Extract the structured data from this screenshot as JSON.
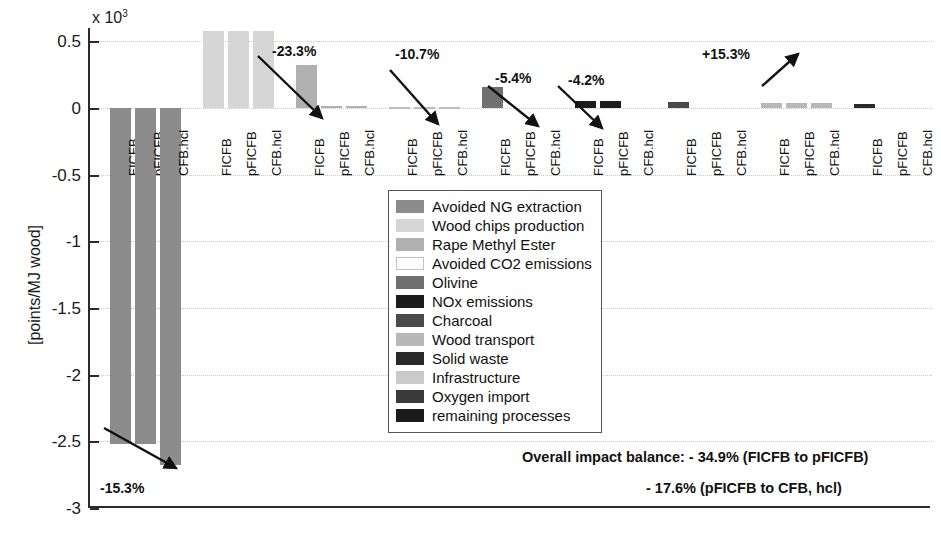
{
  "chart_data": {
    "type": "bar",
    "title": "",
    "xlabel": "",
    "ylabel": "[points/MJ wood]",
    "y_multiplier": "x 10",
    "y_multiplier_exponent": "3",
    "ylim": [
      -3,
      0.6
    ],
    "yticks": [
      0.5,
      0,
      -0.5,
      -1,
      -1.5,
      -2,
      -2.5,
      -3
    ],
    "ytick_labels": [
      "0.5",
      "0",
      "-0.5",
      "-1",
      "-1.5",
      "-2",
      "-2.5",
      "-3"
    ],
    "grid": true,
    "legend_position": "center",
    "categories": [
      "FICFB",
      "pFICFB",
      "CFB.hcl"
    ],
    "series": [
      {
        "name": "Avoided NG extraction",
        "color": "#8c8c8c",
        "values": [
          -2.52,
          -2.52,
          -2.68
        ]
      },
      {
        "name": "Wood chips production",
        "color": "#d6d6d6",
        "values": [
          0.58,
          0.58,
          0.58
        ]
      },
      {
        "name": "Rape Methyl Ester",
        "color": "#b0b0b0",
        "values": [
          0.32,
          0.012,
          0.012
        ]
      },
      {
        "name": "Avoided CO2 emissions",
        "color": "#fdfdfd",
        "values": [
          0.004,
          0.004,
          0.004
        ]
      },
      {
        "name": "Olivine",
        "color": "#707070",
        "values": [
          0.155,
          0.0,
          0.0
        ]
      },
      {
        "name": "NOx emissions",
        "color": "#1c1c1c",
        "values": [
          0.052,
          0.052,
          0.0
        ]
      },
      {
        "name": "Charcoal",
        "color": "#4a4a4a",
        "values": [
          0.048,
          0.0,
          0.0
        ]
      },
      {
        "name": "Wood transport",
        "color": "#b8b8b8",
        "values": [
          0.038,
          0.038,
          0.038
        ]
      },
      {
        "name": "Solid waste",
        "color": "#2a2a2a",
        "values": [
          0.028,
          0.0,
          0.0
        ]
      },
      {
        "name": "Infrastructure",
        "color": "#cacaca",
        "values": [
          0.009,
          0.0,
          0.0
        ]
      },
      {
        "name": "Oxygen import",
        "color": "#3a3a3a",
        "values": [
          0.0,
          0.0,
          0.225
        ]
      },
      {
        "name": "remaining processes",
        "color": "#1a1a1a",
        "values": [
          0.022,
          0.065,
          0.045
        ]
      }
    ],
    "annotations": [
      {
        "label": "-15.3%",
        "group": "Avoided NG extraction",
        "direction": "down-right"
      },
      {
        "label": "-23.3%",
        "group": "Rape Methyl Ester",
        "direction": "down-right"
      },
      {
        "label": "-10.7%",
        "group": "Olivine",
        "direction": "down-right"
      },
      {
        "label": "-5.4%",
        "group": "NOx emissions",
        "direction": "down-right"
      },
      {
        "label": "-4.2%",
        "group": "Charcoal",
        "direction": "down-right"
      },
      {
        "label": "+15.3%",
        "group": "Oxygen import",
        "direction": "up-right"
      }
    ],
    "footnotes": [
      "Overall impact balance: - 34.9% (FICFB to pFICFB)",
      "- 17.6% (pFICFB to CFB, hcl)"
    ]
  },
  "axis": {
    "y_title": "[points/MJ wood]",
    "exp_prefix": "x 10",
    "exp_sup": "3",
    "ticks": [
      {
        "label": "0.5",
        "value": 0.5
      },
      {
        "label": "0",
        "value": 0
      },
      {
        "label": "-0.5",
        "value": -0.5
      },
      {
        "label": "-1",
        "value": -1
      },
      {
        "label": "-1.5",
        "value": -1.5
      },
      {
        "label": "-2",
        "value": -2
      },
      {
        "label": "-2.5",
        "value": -2.5
      },
      {
        "label": "-3",
        "value": -3
      }
    ]
  },
  "groups": [
    {
      "name": "Avoided NG extraction",
      "bar_labels": [
        "FICFB",
        "pFICFB",
        "CFB.hcl"
      ]
    },
    {
      "name": "Wood chips production",
      "bar_labels": [
        "FICFB",
        "pFICFB",
        "CFB.hcl"
      ]
    },
    {
      "name": "Rape Methyl Ester",
      "bar_labels": [
        "FICFB",
        "pFICFB",
        "CFB.hcl"
      ]
    },
    {
      "name": "Avoided CO2 emissions",
      "bar_labels": [
        "FICFB",
        "pFICFB",
        "CFB.hcl"
      ]
    },
    {
      "name": "Olivine",
      "bar_labels": [
        "FICFB",
        "pFICFB",
        "CFB.hcl"
      ]
    },
    {
      "name": "NOx emissions",
      "bar_labels": [
        "FICFB",
        "pFICFB",
        "CFB.hcl"
      ]
    },
    {
      "name": "Charcoal",
      "bar_labels": [
        "FICFB",
        "pFICFB",
        "CFB.hcl"
      ]
    },
    {
      "name": "Wood transport",
      "bar_labels": [
        "FICFB",
        "pFICFB",
        "CFB.hcl"
      ]
    },
    {
      "name": "Solid waste",
      "bar_labels": [
        "FICFB",
        "pFICFB",
        "CFB.hcl"
      ]
    },
    {
      "name": "Infrastructure",
      "bar_labels": [
        "FICFB",
        "pFICFB",
        "CFB.hcl"
      ]
    },
    {
      "name": "Oxygen import",
      "bar_labels": [
        "FICFB",
        "pFICFB",
        "CFB.hcl"
      ]
    },
    {
      "name": "remaining processes",
      "bar_labels": [
        "FICFB",
        "pFICFB",
        "CFB.hcl"
      ]
    }
  ],
  "legend": {
    "items": [
      {
        "label": "Avoided NG extraction",
        "color": "#8c8c8c"
      },
      {
        "label": "Wood chips production",
        "color": "#d6d6d6"
      },
      {
        "label": "Rape Methyl Ester",
        "color": "#b0b0b0"
      },
      {
        "label": "Avoided CO2 emissions",
        "color": "#fdfdfd"
      },
      {
        "label": "Olivine",
        "color": "#707070"
      },
      {
        "label": "NOx emissions",
        "color": "#1c1c1c"
      },
      {
        "label": "Charcoal",
        "color": "#4a4a4a"
      },
      {
        "label": "Wood transport",
        "color": "#b8b8b8"
      },
      {
        "label": "Solid waste",
        "color": "#2a2a2a"
      },
      {
        "label": "Infrastructure",
        "color": "#cacaca"
      },
      {
        "label": "Oxygen import",
        "color": "#3a3a3a"
      },
      {
        "label": "remaining processes",
        "color": "#1a1a1a"
      }
    ]
  },
  "notes": {
    "line1": "Overall impact balance: - 34.9% (FICFB to pFICFB)",
    "line2": "- 17.6% (pFICFB to CFB, hcl)"
  }
}
